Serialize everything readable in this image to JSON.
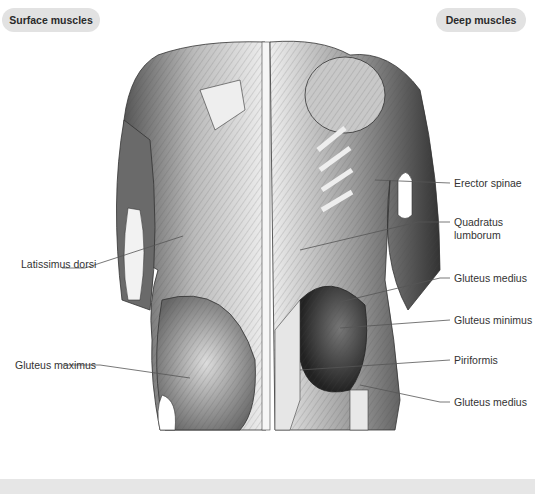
{
  "tabs": {
    "left": "Surface muscles",
    "right": "Deep muscles"
  },
  "labels": {
    "left": [
      {
        "text": "Latissimus dorsi",
        "x": 21,
        "y": 264
      },
      {
        "text": "Gluteus maximus",
        "x": 15,
        "y": 360
      }
    ],
    "right": [
      {
        "text": "Erector spinae",
        "x": 454,
        "y": 179
      },
      {
        "text": "Quadratus",
        "x": 454,
        "y": 219
      },
      {
        "text": "lumborum",
        "x": 454,
        "y": 232
      },
      {
        "text": "Gluteus medius",
        "x": 454,
        "y": 274
      },
      {
        "text": "Gluteus minimus",
        "x": 454,
        "y": 316
      },
      {
        "text": "Piriformis",
        "x": 454,
        "y": 357
      },
      {
        "text": "Gluteus medius",
        "x": 454,
        "y": 398
      }
    ]
  },
  "colors": {
    "tab_bg": "#e2e2e2",
    "footer_bg": "#e6e6e6",
    "muscle_dark": "#3a3a3a",
    "muscle_mid": "#8a8a8a",
    "muscle_light": "#d8d8d8"
  }
}
